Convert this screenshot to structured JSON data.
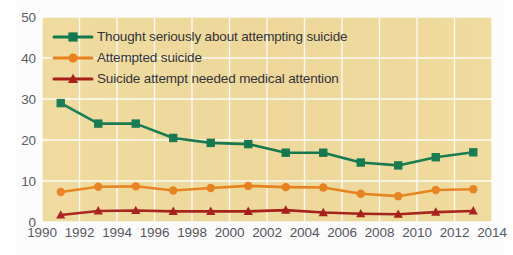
{
  "chart_data": {
    "type": "line",
    "title": "",
    "subtitle": "",
    "xlabel": "",
    "ylabel": "",
    "xlim": [
      1990,
      2014
    ],
    "ylim": [
      0,
      50
    ],
    "grid": true,
    "legend_position": "top-left",
    "x_tick_labels": [
      "1990",
      "1992",
      "1994",
      "1996",
      "1998",
      "2000",
      "2002",
      "2004",
      "2006",
      "2008",
      "2010",
      "2012",
      "2014"
    ],
    "x_ticks": [
      1990,
      1992,
      1994,
      1996,
      1998,
      2000,
      2002,
      2004,
      2006,
      2008,
      2010,
      2012,
      2014
    ],
    "y_tick_labels": [
      "0",
      "10",
      "20",
      "30",
      "40",
      "50"
    ],
    "y_ticks": [
      0,
      10,
      20,
      30,
      40,
      50
    ],
    "x": [
      1991,
      1993,
      1995,
      1997,
      1999,
      2001,
      2003,
      2005,
      2007,
      2009,
      2011,
      2013
    ],
    "series": [
      {
        "name": "Thought seriously about attempting suicide",
        "color": "#13794f",
        "marker": "square",
        "values": [
          29.0,
          24.0,
          24.0,
          20.5,
          19.3,
          19.0,
          16.9,
          16.9,
          14.5,
          13.8,
          15.8,
          17.0
        ]
      },
      {
        "name": "Attempted suicide",
        "color": "#e8821e",
        "marker": "circle",
        "values": [
          7.3,
          8.6,
          8.7,
          7.7,
          8.3,
          8.8,
          8.5,
          8.4,
          6.9,
          6.3,
          7.8,
          8.0
        ]
      },
      {
        "name": "Suicide attempt needed medical attention",
        "color": "#a81f1a",
        "marker": "triangle",
        "values": [
          1.7,
          2.7,
          2.8,
          2.6,
          2.6,
          2.6,
          2.9,
          2.3,
          2.0,
          1.9,
          2.4,
          2.7
        ]
      }
    ]
  },
  "style": {
    "plot_background": "#f0da9c",
    "gridline_color": "#ffffff",
    "page_background": "#fdfdfd",
    "tick_label_color": "#54545c",
    "legend_text_color": "#333338"
  },
  "legend": {
    "items": [
      {
        "label": "Thought seriously about attempting suicide",
        "color": "#13794f",
        "marker": "square"
      },
      {
        "label": "Attempted suicide",
        "color": "#e8821e",
        "marker": "circle"
      },
      {
        "label": "Suicide attempt needed medical attention",
        "color": "#a81f1a",
        "marker": "triangle"
      }
    ]
  }
}
